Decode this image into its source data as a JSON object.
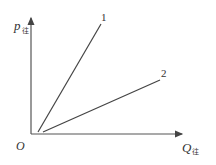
{
  "diagram": {
    "y_axis": {
      "symbol": "p",
      "subscript": "往"
    },
    "x_axis": {
      "symbol": "Q",
      "subscript": "往"
    },
    "origin_label": "O",
    "curves": [
      {
        "label": "1",
        "x1": 38,
        "y1": 132,
        "x2": 101,
        "y2": 24
      },
      {
        "label": "2",
        "x1": 43,
        "y1": 132,
        "x2": 160,
        "y2": 80
      }
    ],
    "colors": {
      "line": "#444444",
      "text": "#333333"
    }
  }
}
